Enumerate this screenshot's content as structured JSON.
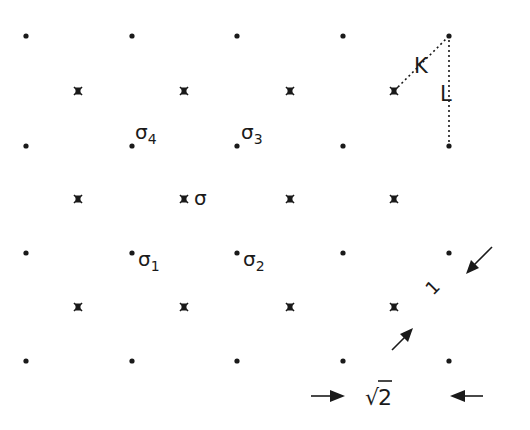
{
  "diagram": {
    "ink_color": "#1a1a1a",
    "background": "#ffffff",
    "lattice_dots": {
      "columns_x": [
        26,
        132,
        237,
        343,
        449
      ],
      "rows_y": [
        36,
        146,
        253,
        361
      ]
    },
    "lattice_crosses": {
      "columns_x": [
        78,
        184,
        290,
        394
      ],
      "rows_y": [
        91,
        199,
        307
      ]
    },
    "labels": {
      "sigma": "σ",
      "sigma1": "σ",
      "sigma1_sub": "1",
      "sigma2": "σ",
      "sigma2_sub": "2",
      "sigma3": "σ",
      "sigma3_sub": "3",
      "sigma4": "σ",
      "sigma4_sub": "4",
      "K": "K",
      "L": "L",
      "one": "1",
      "sqrt_two": "2",
      "sqrt_symbol": "√"
    }
  }
}
